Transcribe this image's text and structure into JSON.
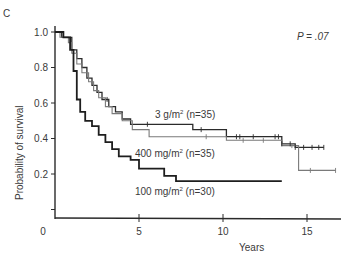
{
  "panel_label": "C",
  "p_value": "P = .07",
  "p_value_prefix": "P",
  "p_value_rest": " = .07",
  "chart_data": {
    "type": "line",
    "subtype": "kaplan-meier step",
    "title": "",
    "xlabel": "Years",
    "ylabel": "Probability of survival",
    "xlim": [
      0,
      17
    ],
    "ylim": [
      0,
      1.0
    ],
    "x_ticks": [
      0,
      5,
      10,
      15
    ],
    "y_ticks": [
      0.2,
      0.4,
      0.6,
      0.8,
      1.0
    ],
    "y_tick_labels": [
      "0.2",
      "0.4",
      "0.6",
      "0.8",
      "1.0"
    ],
    "x_tick_labels": [
      "0",
      "5",
      "10",
      "15"
    ],
    "grid": false,
    "legend": "inline labels",
    "annotation": "P = .07",
    "series": [
      {
        "name": "3 g/m2 (n=35)",
        "color": "#2b2b2b",
        "x": [
          0,
          0.4,
          0.7,
          1.0,
          1.3,
          1.6,
          1.9,
          2.2,
          2.5,
          2.8,
          3.2,
          3.6,
          4.0,
          4.5,
          8.2,
          10.2,
          13.5,
          14.3,
          16.0
        ],
        "y": [
          1.0,
          0.97,
          0.97,
          0.9,
          0.85,
          0.8,
          0.74,
          0.7,
          0.66,
          0.62,
          0.58,
          0.55,
          0.51,
          0.48,
          0.45,
          0.41,
          0.37,
          0.35,
          0.35
        ]
      },
      {
        "name": "400 mg/m2 (n=35)",
        "color": "#7a7a7a",
        "x": [
          0,
          0.3,
          0.8,
          1.0,
          1.3,
          1.6,
          2.0,
          2.3,
          2.6,
          3.0,
          3.4,
          4.0,
          4.6,
          5.6,
          10.2,
          13.5,
          14.5,
          16.7
        ],
        "y": [
          1.0,
          0.97,
          0.94,
          0.88,
          0.82,
          0.77,
          0.72,
          0.67,
          0.63,
          0.58,
          0.54,
          0.5,
          0.45,
          0.41,
          0.39,
          0.36,
          0.22,
          0.22
        ]
      },
      {
        "name": "100 mg/m2 (n=30)",
        "color": "#1e1e1e",
        "x": [
          0,
          0.5,
          0.9,
          1.1,
          1.3,
          1.5,
          1.8,
          2.2,
          2.6,
          3.0,
          3.4,
          3.8,
          4.5,
          5.0,
          6.5,
          7.2,
          13.5
        ],
        "y": [
          1.0,
          0.97,
          0.9,
          0.78,
          0.62,
          0.55,
          0.5,
          0.47,
          0.42,
          0.38,
          0.34,
          0.3,
          0.28,
          0.23,
          0.19,
          0.16,
          0.16
        ]
      }
    ],
    "series_labels": [
      {
        "text": "3 g/m",
        "sup": "2",
        "suffix": " (n=35)"
      },
      {
        "text": "400 mg/m",
        "sup": "2",
        "suffix": " (n=35)"
      },
      {
        "text": "100 mg/m",
        "sup": "2",
        "suffix": " (n=30)"
      }
    ]
  }
}
